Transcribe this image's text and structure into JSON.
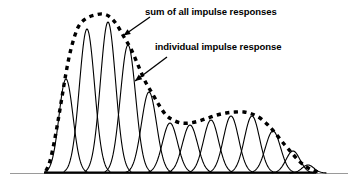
{
  "figure": {
    "annotations": [
      {
        "id": "sum-of-all-impulse-responses",
        "text": "sum of all impulse responses",
        "arrow": {
          "x1": 150,
          "y1": 17,
          "x2": 123.5,
          "y2": 35.5
        }
      },
      {
        "id": "individual-impulse-response",
        "text": "individual impulse response",
        "arrow": {
          "x1": 167,
          "y1": 57,
          "x2": 135,
          "y2": 81
        }
      }
    ],
    "colors": {
      "curve": "#000000",
      "envelope": "#000000",
      "axis": "#9a9a9a",
      "baseline": "#000000",
      "background": "#ffffff"
    },
    "axis": {
      "baseline_y": 173,
      "x_start": 10,
      "x_end": 348,
      "black_segment_start": 44,
      "black_segment_end": 316
    }
  },
  "chart_data": {
    "type": "line",
    "title": "",
    "subtitle": "",
    "xlabel": "",
    "ylabel": "",
    "grid": false,
    "legend_position": "inline-annotations",
    "xlim": [
      44,
      320
    ],
    "ylim": [
      0,
      160
    ],
    "baseline_y_px": 173,
    "series": [
      {
        "name": "individual impulse response",
        "style": "solid-thin",
        "note": "Each entry is one bell curve: center x (px), peak height above baseline (px), half-width sigma (px).",
        "impulses": [
          {
            "index": 1,
            "center": 66,
            "height": 94,
            "sigma": 7.0
          },
          {
            "index": 2,
            "center": 87,
            "height": 144,
            "sigma": 7.6
          },
          {
            "index": 3,
            "center": 108,
            "height": 151,
            "sigma": 7.6
          },
          {
            "index": 4,
            "center": 128,
            "height": 128,
            "sigma": 7.6
          },
          {
            "index": 5,
            "center": 149,
            "height": 81,
            "sigma": 7.6
          },
          {
            "index": 6,
            "center": 170,
            "height": 50,
            "sigma": 7.6
          },
          {
            "index": 7,
            "center": 190,
            "height": 48,
            "sigma": 7.6
          },
          {
            "index": 8,
            "center": 211,
            "height": 53,
            "sigma": 7.6
          },
          {
            "index": 9,
            "center": 231,
            "height": 57,
            "sigma": 7.6
          },
          {
            "index": 10,
            "center": 252,
            "height": 57,
            "sigma": 7.6
          },
          {
            "index": 11,
            "center": 273,
            "height": 42,
            "sigma": 7.6
          },
          {
            "index": 12,
            "center": 293,
            "height": 22,
            "sigma": 7.0
          },
          {
            "index": 13,
            "center": 308,
            "height": 8,
            "sigma": 6.0
          }
        ]
      },
      {
        "name": "sum of all impulse responses",
        "style": "dashed-thick",
        "note": "Envelope = sum of the individual impulse responses; sampled points as x (px), height above baseline (px).",
        "envelope": [
          {
            "x": 46,
            "h": 2
          },
          {
            "x": 50,
            "h": 12
          },
          {
            "x": 54,
            "h": 30
          },
          {
            "x": 58,
            "h": 52
          },
          {
            "x": 62,
            "h": 76
          },
          {
            "x": 66,
            "h": 100
          },
          {
            "x": 70,
            "h": 120
          },
          {
            "x": 75,
            "h": 138
          },
          {
            "x": 80,
            "h": 149
          },
          {
            "x": 87,
            "h": 155
          },
          {
            "x": 95,
            "h": 158
          },
          {
            "x": 103,
            "h": 159
          },
          {
            "x": 110,
            "h": 156
          },
          {
            "x": 117,
            "h": 148
          },
          {
            "x": 124,
            "h": 136
          },
          {
            "x": 131,
            "h": 124
          },
          {
            "x": 138,
            "h": 108
          },
          {
            "x": 145,
            "h": 92
          },
          {
            "x": 152,
            "h": 80
          },
          {
            "x": 159,
            "h": 68
          },
          {
            "x": 166,
            "h": 58
          },
          {
            "x": 173,
            "h": 53
          },
          {
            "x": 181,
            "h": 50
          },
          {
            "x": 190,
            "h": 50
          },
          {
            "x": 199,
            "h": 52
          },
          {
            "x": 208,
            "h": 55
          },
          {
            "x": 217,
            "h": 58
          },
          {
            "x": 226,
            "h": 60
          },
          {
            "x": 235,
            "h": 61
          },
          {
            "x": 244,
            "h": 61
          },
          {
            "x": 252,
            "h": 59
          },
          {
            "x": 260,
            "h": 55
          },
          {
            "x": 268,
            "h": 48
          },
          {
            "x": 276,
            "h": 39
          },
          {
            "x": 284,
            "h": 29
          },
          {
            "x": 291,
            "h": 21
          },
          {
            "x": 298,
            "h": 13
          },
          {
            "x": 305,
            "h": 7
          },
          {
            "x": 312,
            "h": 3
          },
          {
            "x": 318,
            "h": 1
          }
        ]
      }
    ]
  }
}
